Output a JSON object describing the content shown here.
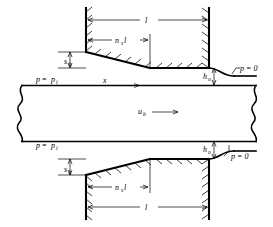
{
  "figure": {
    "type": "engineering-cross-section-diagram",
    "width": 273,
    "height": 227,
    "background": "#ffffff",
    "line_color": "#000000"
  },
  "labels": {
    "length_top": "l",
    "length_bottom": "l",
    "taper_top": "ns l",
    "taper_bottom": "ns l",
    "taper_base": "n",
    "taper_sub": "s",
    "taper_tail": "l",
    "step_top": "s",
    "step_top_sub": "h",
    "step_bottom": "s",
    "step_bottom_sub": "h",
    "film_top": "h",
    "film_top_sub": "o",
    "film_bottom": "h",
    "film_bottom_sub": "o",
    "pressure_inlet_top_lhs": "p",
    "pressure_inlet_top_rhs": "p",
    "pressure_inlet_top_sub": "i",
    "pressure_inlet_bottom_lhs": "p",
    "pressure_inlet_bottom_rhs": "p",
    "pressure_inlet_bottom_sub": "i",
    "pressure_exit_top": "p = 0",
    "pressure_exit_bottom": "p = 0",
    "axis_x": "x",
    "velocity": "u",
    "velocity_sub": "b",
    "equals": "="
  },
  "annotations": {
    "inlet_pressure_expr": "p = pi",
    "exit_pressure_expr": "p = 0",
    "belt_velocity_expr": "ub",
    "axis_label": "x",
    "land_length_expr": "l",
    "taper_length_expr": "ns l",
    "step_height_expr": "sh",
    "film_thickness_expr": "ho"
  },
  "geometry": {
    "bearing_top": {
      "wall_left_x": 86,
      "wall_right_x": 209,
      "wall_top_y": 8,
      "land_y": 68,
      "taper_start_y": 52,
      "taper_end_x": 150
    },
    "bearing_bottom": {
      "wall_left_x": 86,
      "wall_right_x": 209,
      "wall_bottom_y": 219,
      "land_y": 159,
      "taper_start_y": 175,
      "taper_end_x": 150
    },
    "channel": {
      "top_y": 85,
      "bottom_y": 142,
      "left_x": 17,
      "right_x": 256
    },
    "dimensions": {
      "length_line_top_y": 20,
      "taper_line_top_y": 40,
      "length_line_bottom_y": 207,
      "taper_line_bottom_y": 187
    }
  }
}
